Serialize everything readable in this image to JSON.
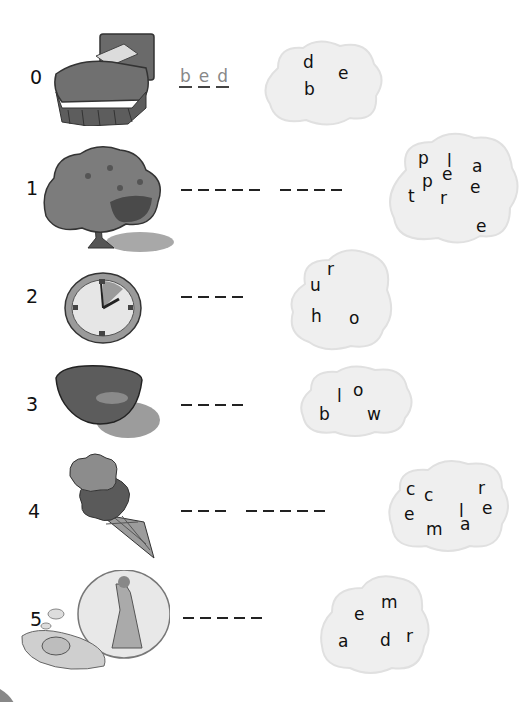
{
  "worksheet": {
    "items": [
      {
        "number": "0",
        "picture": "bed",
        "answer_letters": [
          "b",
          "e",
          "d"
        ],
        "blank_groups": [],
        "cloud_letters": [
          {
            "ch": "d",
            "x": 45,
            "y": 16
          },
          {
            "ch": "e",
            "x": 80,
            "y": 27
          },
          {
            "ch": "b",
            "x": 46,
            "y": 43
          }
        ]
      },
      {
        "number": "1",
        "picture": "apple-tree",
        "answer_letters": [],
        "blank_groups": [
          5,
          4
        ],
        "cloud_letters": [
          {
            "ch": "p",
            "x": 34,
            "y": 22
          },
          {
            "ch": "l",
            "x": 63,
            "y": 25
          },
          {
            "ch": "a",
            "x": 88,
            "y": 30
          },
          {
            "ch": "p",
            "x": 38,
            "y": 45
          },
          {
            "ch": "e",
            "x": 58,
            "y": 38
          },
          {
            "ch": "e",
            "x": 86,
            "y": 51
          },
          {
            "ch": "t",
            "x": 24,
            "y": 60
          },
          {
            "ch": "r",
            "x": 56,
            "y": 62
          },
          {
            "ch": "e",
            "x": 92,
            "y": 90
          }
        ]
      },
      {
        "number": "2",
        "picture": "clock",
        "answer_letters": [],
        "blank_groups": [
          4
        ],
        "cloud_letters": [
          {
            "ch": "r",
            "x": 42,
            "y": 17
          },
          {
            "ch": "u",
            "x": 25,
            "y": 33
          },
          {
            "ch": "h",
            "x": 26,
            "y": 64
          },
          {
            "ch": "o",
            "x": 64,
            "y": 66
          }
        ]
      },
      {
        "number": "3",
        "picture": "bowl",
        "answer_letters": [],
        "blank_groups": [
          4
        ],
        "cloud_letters": [
          {
            "ch": "l",
            "x": 40,
            "y": 24
          },
          {
            "ch": "o",
            "x": 56,
            "y": 18
          },
          {
            "ch": "b",
            "x": 22,
            "y": 42
          },
          {
            "ch": "w",
            "x": 70,
            "y": 42
          }
        ]
      },
      {
        "number": "4",
        "picture": "ice-cream",
        "answer_letters": [],
        "blank_groups": [
          3,
          5
        ],
        "cloud_letters": [
          {
            "ch": "c",
            "x": 22,
            "y": 25
          },
          {
            "ch": "c",
            "x": 40,
            "y": 31
          },
          {
            "ch": "r",
            "x": 94,
            "y": 24
          },
          {
            "ch": "l",
            "x": 75,
            "y": 47
          },
          {
            "ch": "e",
            "x": 98,
            "y": 44
          },
          {
            "ch": "e",
            "x": 20,
            "y": 50
          },
          {
            "ch": "m",
            "x": 42,
            "y": 65
          },
          {
            "ch": "a",
            "x": 76,
            "y": 60
          }
        ]
      },
      {
        "number": "5",
        "picture": "dream",
        "answer_letters": [],
        "blank_groups": [
          5
        ],
        "cloud_letters": [
          {
            "ch": "m",
            "x": 63,
            "y": 22
          },
          {
            "ch": "e",
            "x": 36,
            "y": 34
          },
          {
            "ch": "a",
            "x": 20,
            "y": 61
          },
          {
            "ch": "d",
            "x": 62,
            "y": 60
          },
          {
            "ch": "r",
            "x": 88,
            "y": 56
          }
        ]
      }
    ]
  },
  "colors": {
    "cloud_fill": "#efefef",
    "cloud_edge": "#e2e2e2",
    "ink": "#111111",
    "example_ink": "#888888",
    "picture_gray": "#6a6a6a"
  }
}
